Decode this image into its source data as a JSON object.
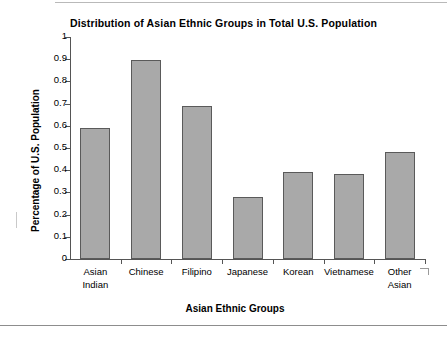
{
  "chart_data": {
    "type": "bar",
    "title": "Distribution of Asian Ethnic Groups in Total U.S. Population",
    "xlabel": "Asian Ethnic Groups",
    "ylabel": "Percentage of U.S. Population",
    "categories": [
      "Asian\nIndian",
      "Chinese",
      "Filipino",
      "Japanese",
      "Korean",
      "Vietnamese",
      "Other\nAsian"
    ],
    "values": [
      0.59,
      0.895,
      0.69,
      0.28,
      0.39,
      0.385,
      0.48
    ],
    "ylim": [
      0,
      1
    ],
    "ytick_labels": [
      "0",
      "0.1",
      "0.2",
      "0.3",
      "0.4",
      "0.5",
      "0.6",
      "0.7",
      "0.8",
      "0.9",
      "1"
    ],
    "ytick_values": [
      0,
      0.1,
      0.2,
      0.3,
      0.4,
      0.5,
      0.6,
      0.7,
      0.8,
      0.9,
      1
    ],
    "grid": false,
    "legend": null,
    "bar_fill_color": "#a9a9a9",
    "bar_border_color": "#5a5a5a",
    "axis_color": "#555555"
  }
}
